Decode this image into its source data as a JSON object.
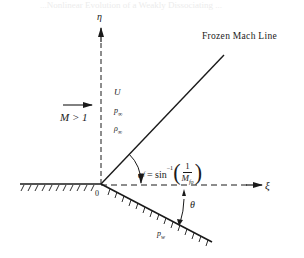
{
  "header_bleed": "...Nonlinear Evolution of a Weakly Dissociating ...",
  "axes": {
    "vertical_label": "η",
    "horizontal_label": "ξ",
    "origin_label": "0"
  },
  "mach_line": {
    "label": "Frozen Mach Line"
  },
  "freestream": {
    "mach_label": "M > 1",
    "velocity": "U",
    "pressure": "p",
    "pressure_sub": "∞",
    "density": "ρ",
    "density_sub": "∞"
  },
  "angle_formula": {
    "alpha": "α",
    "alpha_sub": "f",
    "equals": " = sin",
    "inverse": "−1",
    "numerator": "1",
    "denominator": "M",
    "denominator_sub": "fo"
  },
  "wedge": {
    "angle_label": "θ",
    "wall_pressure": "p",
    "wall_pressure_sub": "w"
  },
  "colors": {
    "ink": "#1a1a1a",
    "background": "#ffffff"
  }
}
